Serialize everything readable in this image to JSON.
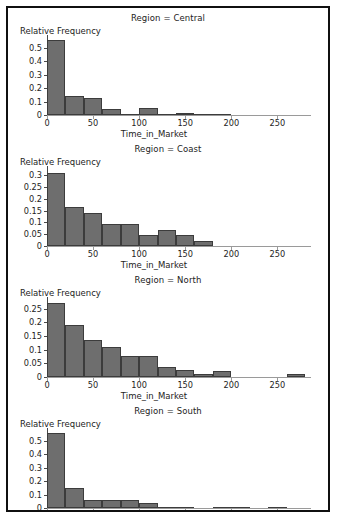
{
  "figure": {
    "axis_label_y": "Relative Frequency",
    "axis_label_x": "Time_in_Market",
    "bar_color": "#6e6e6e",
    "bar_border_color": "#3c3c3c",
    "frame_color": "#101010",
    "background": "#ffffff"
  },
  "chart_data": [
    {
      "type": "bar",
      "title": "Region = Central",
      "xlabel": "Time_in_Market",
      "ylabel": "Relative Frequency",
      "xlim": [
        0,
        280
      ],
      "ylim": [
        0,
        0.58
      ],
      "xticks": [
        0,
        50,
        100,
        150,
        200,
        250
      ],
      "yticks": [
        0,
        0.1,
        0.2,
        0.3,
        0.4,
        0.5
      ],
      "ytick_labels": [
        "0",
        "0.1",
        "0.2",
        "0.3",
        "0.4",
        "0.5"
      ],
      "bin_width": 20,
      "bin_starts": [
        0,
        20,
        40,
        60,
        80,
        100,
        120,
        140,
        160,
        180
      ],
      "values": [
        0.555,
        0.14,
        0.13,
        0.045,
        0.01,
        0.055,
        0.005,
        0.015,
        0.005,
        0.003
      ],
      "grid": false,
      "legend": "none"
    },
    {
      "type": "bar",
      "title": "Region = Coast",
      "xlabel": "Time_in_Market",
      "ylabel": "Relative Frequency",
      "xlim": [
        0,
        280
      ],
      "ylim": [
        0,
        0.33
      ],
      "xticks": [
        0,
        50,
        100,
        150,
        200,
        250
      ],
      "yticks": [
        0,
        0.05,
        0.1,
        0.15,
        0.2,
        0.25,
        0.3
      ],
      "ytick_labels": [
        "0",
        "0.05",
        "0.1",
        "0.15",
        "0.2",
        "0.25",
        "0.3"
      ],
      "bin_width": 20,
      "bin_starts": [
        0,
        20,
        40,
        60,
        80,
        100,
        120,
        140,
        160
      ],
      "values": [
        0.31,
        0.165,
        0.14,
        0.095,
        0.095,
        0.045,
        0.068,
        0.048,
        0.02
      ],
      "grid": false,
      "legend": "none"
    },
    {
      "type": "bar",
      "title": "Region = North",
      "xlabel": "Time_in_Market",
      "ylabel": "Relative Frequency",
      "xlim": [
        0,
        280
      ],
      "ylim": [
        0,
        0.285
      ],
      "xticks": [
        0,
        50,
        100,
        150,
        200,
        250
      ],
      "yticks": [
        0,
        0.05,
        0.1,
        0.15,
        0.2,
        0.25
      ],
      "ytick_labels": [
        "0",
        "0.05",
        "0.1",
        "0.15",
        "0.2",
        "0.25"
      ],
      "bin_width": 20,
      "bin_starts": [
        0,
        20,
        40,
        60,
        80,
        100,
        120,
        140,
        160,
        180,
        260
      ],
      "values": [
        0.27,
        0.19,
        0.135,
        0.108,
        0.078,
        0.078,
        0.038,
        0.025,
        0.01,
        0.021,
        0.012
      ],
      "grid": false,
      "legend": "none"
    },
    {
      "type": "bar",
      "title": "Region = South",
      "xlabel": "Time_in_Market",
      "ylabel": "Relative Frequency",
      "xlim": [
        0,
        280
      ],
      "ylim": [
        0,
        0.58
      ],
      "xticks": [
        0,
        50,
        100,
        150,
        200,
        250
      ],
      "yticks": [
        0,
        0.1,
        0.2,
        0.3,
        0.4,
        0.5
      ],
      "ytick_labels": [
        "0",
        "0.1",
        "0.2",
        "0.3",
        "0.4",
        "0.5"
      ],
      "bin_width": 20,
      "bin_starts": [
        0,
        20,
        40,
        60,
        80,
        100,
        120,
        140,
        180,
        200,
        240
      ],
      "values": [
        0.555,
        0.152,
        0.06,
        0.06,
        0.06,
        0.04,
        0.008,
        0.008,
        0.004,
        0.004,
        0.004
      ],
      "grid": false,
      "legend": "none"
    }
  ]
}
